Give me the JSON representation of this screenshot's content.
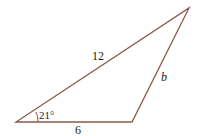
{
  "diagram": {
    "type": "triangle",
    "line_color": "#8b5a4a",
    "vertices": {
      "left": [
        16,
        122
      ],
      "bottom_right": [
        132,
        122
      ],
      "top": [
        189,
        8
      ]
    },
    "labels": {
      "hypotenuse": "12",
      "base": "6",
      "right_side": "b",
      "angle": "21°"
    }
  }
}
